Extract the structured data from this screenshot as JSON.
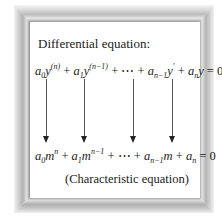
{
  "figure": {
    "heading": "Differential equation:",
    "differential_equation": {
      "terms": [
        {
          "coef": "a",
          "coef_sub": "0",
          "var": "y",
          "sup": "(n)"
        },
        {
          "coef": "a",
          "coef_sub": "1",
          "var": "y",
          "sup": "(n−1)"
        },
        {
          "ellipsis": "⋯"
        },
        {
          "coef": "a",
          "coef_sub": "n−1",
          "var": "y",
          "sup": "′"
        },
        {
          "coef": "a",
          "coef_sub": "n",
          "var": "y",
          "sup": ""
        }
      ],
      "rhs": "0",
      "text": "a0 y^(n) + a1 y^(n-1) + ⋯ + a(n-1) y' + a(n) y = 0"
    },
    "arrows": [
      {
        "x": 46,
        "label": "a0 term"
      },
      {
        "x": 84,
        "label": "a1 term"
      },
      {
        "x": 133,
        "label": "a(n-1) term"
      },
      {
        "x": 172,
        "label": "a(n) term"
      }
    ],
    "characteristic_equation": {
      "terms": [
        {
          "coef": "a",
          "coef_sub": "0",
          "var": "m",
          "sup": "n"
        },
        {
          "coef": "a",
          "coef_sub": "1",
          "var": "m",
          "sup": "n−1"
        },
        {
          "ellipsis": "⋯"
        },
        {
          "coef": "a",
          "coef_sub": "n−1",
          "var": "m",
          "sup": ""
        },
        {
          "coef": "a",
          "coef_sub": "n",
          "var": "",
          "sup": ""
        }
      ],
      "rhs": "0",
      "text": "a0 m^n + a1 m^(n-1) + ⋯ + a(n-1) m + a(n) = 0"
    },
    "caption": "(Characteristic equation)",
    "frame_colors": {
      "light": "#f2f2f2",
      "mid": "#b4b4b4",
      "dark": "#8e8e8e"
    }
  }
}
